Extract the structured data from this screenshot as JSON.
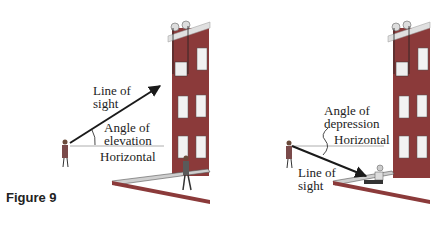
{
  "figure": {
    "caption": "Figure 9",
    "left_panel": {
      "line_of_sight": [
        "Line of",
        "sight"
      ],
      "angle": [
        "Angle of",
        "elevation"
      ],
      "horizontal": "Horizontal"
    },
    "right_panel": {
      "angle": [
        "Angle of",
        "depression"
      ],
      "horizontal": "Horizontal",
      "line_of_sight": [
        "Line of",
        "sight"
      ]
    }
  },
  "colors": {
    "building": "#8b3a3a",
    "window": "#f2f2f2",
    "line": "#1a1a1a",
    "horizontal": "#9a9a9a"
  }
}
